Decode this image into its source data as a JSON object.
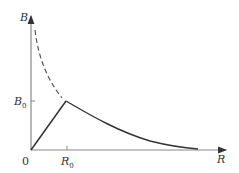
{
  "diagram": {
    "type": "field-vs-radius",
    "axes": {
      "y_label": "B",
      "x_label": "R",
      "origin_label": "0",
      "y_tick_label": "B",
      "y_tick_sub": "0",
      "x_tick_label": "R",
      "x_tick_sub": "0"
    },
    "curves": [
      {
        "name": "inside-linear",
        "style": "solid",
        "description": "B rises linearly from 0 to B0 at R0"
      },
      {
        "name": "outside-decay",
        "style": "solid",
        "description": "B decays as 1/R beyond R0"
      },
      {
        "name": "extrapolated-decay",
        "style": "dashed",
        "description": "1/R curve extended inside R0"
      }
    ],
    "colors": {
      "axis": "#555555",
      "curve": "#333333",
      "dashed": "#555555"
    }
  }
}
